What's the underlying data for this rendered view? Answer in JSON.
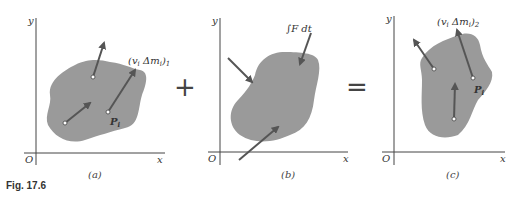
{
  "figure": {
    "caption": "Fig. 17.6",
    "panels": [
      {
        "id": "a",
        "label": "(a)",
        "axis_x": "x",
        "axis_y": "y",
        "origin": "O",
        "momentum_label": "(v",
        "momentum_sub": "i",
        "momentum_rest": " Δm",
        "momentum_sub2": "i",
        "momentum_close": ")",
        "momentum_index": "1",
        "point_label": "P",
        "point_sub": "i"
      },
      {
        "id": "b",
        "label": "(b)",
        "axis_x": "x",
        "axis_y": "y",
        "origin": "O",
        "impulse_label": "∫F dt"
      },
      {
        "id": "c",
        "label": "(c)",
        "axis_x": "x",
        "axis_y": "y",
        "origin": "O",
        "momentum_label": "(v",
        "momentum_sub": "i",
        "momentum_rest": " Δm",
        "momentum_sub2": "i",
        "momentum_close": ")",
        "momentum_index": "2",
        "point_label": "P",
        "point_sub": "i"
      }
    ],
    "operators": {
      "plus": "+",
      "equals": "="
    },
    "colors": {
      "body_fill": "#9a9a9a",
      "arrow": "#555555",
      "axis": "#444444"
    }
  }
}
